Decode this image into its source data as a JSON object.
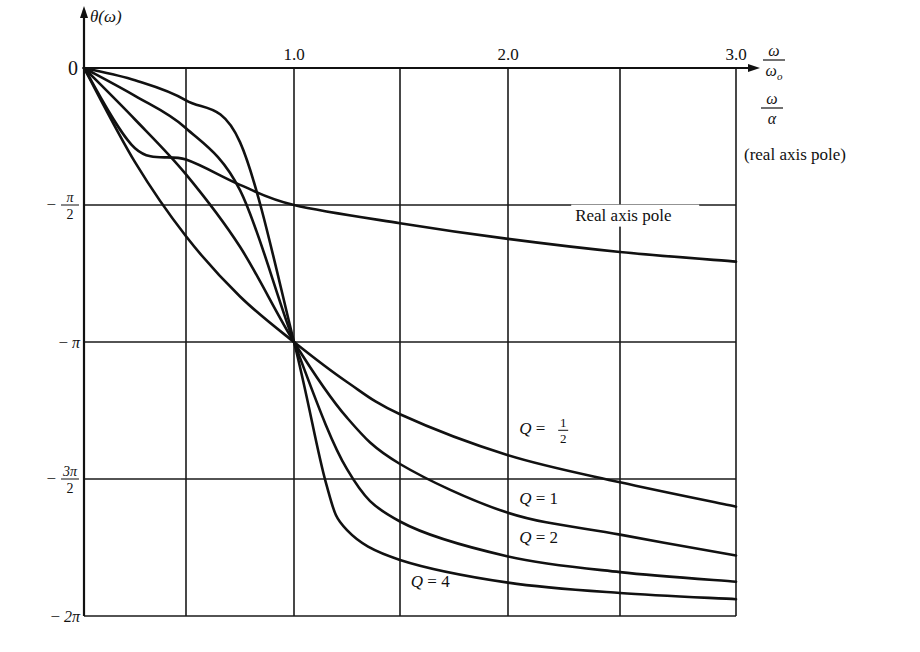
{
  "chart_data": {
    "type": "line",
    "title": "",
    "xlabel": "ω/ω_o ; ω/α (real axis pole)",
    "ylabel": "θ(ω)",
    "x_axis": {
      "label_top": "ω",
      "label_bottom": "ωo",
      "label2_top": "ω",
      "label2_bottom": "α",
      "note": "(real axis pole)",
      "ticks": [
        {
          "value": 1.0,
          "label": "1.0"
        },
        {
          "value": 2.0,
          "label": "2.0"
        },
        {
          "value": 3.0,
          "label": "3.0"
        }
      ],
      "gridlines": [
        0.5,
        1.0,
        1.5,
        2.0,
        2.5,
        3.0
      ],
      "range": [
        0,
        3.0
      ]
    },
    "y_axis": {
      "label": "θ(ω)",
      "ticks": [
        {
          "value": 0,
          "label": "0"
        },
        {
          "value": -1.5708,
          "label": "− π/2",
          "num": "π",
          "den": "2",
          "prefix": "−"
        },
        {
          "value": -3.1416,
          "label": "− π",
          "prefix": "−",
          "num": "π"
        },
        {
          "value": -4.7124,
          "label": "− 3π/2",
          "num": "3π",
          "den": "2",
          "prefix": "−"
        },
        {
          "value": -6.2832,
          "label": "−2π",
          "prefix": "−",
          "num": "2π"
        }
      ],
      "range": [
        -6.2832,
        0
      ]
    },
    "grid": true,
    "legend": "inline labels",
    "series": [
      {
        "name": "Real axis pole",
        "label": "Real axis pole",
        "x": [
          0,
          0.25,
          0.5,
          0.75,
          1.0,
          1.5,
          2.0,
          2.5,
          3.0
        ],
        "y": [
          0,
          -0.92,
          -1.05,
          -1.34,
          -1.5708,
          -1.78,
          -1.96,
          -2.11,
          -2.22
        ]
      },
      {
        "name": "Q = 1/2",
        "label": "Q = 1/2",
        "x": [
          0,
          0.25,
          0.5,
          0.75,
          1.0,
          1.25,
          1.5,
          2.0,
          2.5,
          3.0
        ],
        "y": [
          0,
          -1.08,
          -1.93,
          -2.62,
          -3.1416,
          -3.6,
          -3.97,
          -4.44,
          -4.75,
          -5.03
        ]
      },
      {
        "name": "Q = 1",
        "label": "Q = 1",
        "x": [
          0,
          0.25,
          0.5,
          0.75,
          1.0,
          1.25,
          1.5,
          2.0,
          2.5,
          3.0
        ],
        "y": [
          0,
          -0.59,
          -1.22,
          -2.05,
          -3.1416,
          -4.01,
          -4.54,
          -5.1,
          -5.35,
          -5.59
        ]
      },
      {
        "name": "Q = 2",
        "label": "Q = 2",
        "x": [
          0,
          0.25,
          0.5,
          0.75,
          1.0,
          1.25,
          1.5,
          2.0,
          2.5,
          3.0
        ],
        "y": [
          0,
          -0.32,
          -0.69,
          -1.4,
          -3.1416,
          -4.6,
          -5.2,
          -5.6,
          -5.78,
          -5.89
        ]
      },
      {
        "name": "Q = 4",
        "label": "Q = 4",
        "x": [
          0,
          0.25,
          0.5,
          0.75,
          1.0,
          1.15,
          1.25,
          1.5,
          2.0,
          2.5,
          3.0
        ],
        "y": [
          0,
          -0.14,
          -0.37,
          -0.85,
          -3.1416,
          -4.75,
          -5.3,
          -5.64,
          -5.9,
          -6.02,
          -6.09
        ]
      }
    ],
    "annotations": [
      {
        "text": "Real axis pole",
        "x": 2.3,
        "y": -1.75
      },
      {
        "text": "Q = 1/2",
        "x": 2.05,
        "y": -4.2
      },
      {
        "text": "Q = 1",
        "x": 2.05,
        "y": -5.0
      },
      {
        "text": "Q = 2",
        "x": 2.05,
        "y": -5.45
      },
      {
        "text": "Q = 4",
        "x": 1.55,
        "y": -5.95
      }
    ]
  }
}
